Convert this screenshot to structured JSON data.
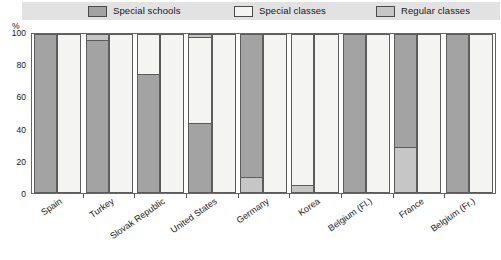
{
  "unit_label": "%",
  "legend": {
    "items": [
      {
        "label": "Special schools",
        "color": "#a3a3a3",
        "key": "special_schools"
      },
      {
        "label": "Special classes",
        "color": "#f4f4f2",
        "key": "special_classes"
      },
      {
        "label": "Regular classes",
        "color": "#c6c6c6",
        "key": "regular_classes"
      }
    ]
  },
  "yaxis": {
    "ticks": [
      "0",
      "20",
      "40",
      "60",
      "80",
      "100"
    ],
    "min": 0,
    "max": 100
  },
  "chart_data": {
    "type": "bar",
    "subtype": "grouped-stacked-100-percent",
    "title": "",
    "subtitle": "",
    "xlabel": "",
    "ylabel": "%",
    "ylim": [
      0,
      100
    ],
    "yticks": [
      0,
      20,
      40,
      60,
      80,
      100
    ],
    "grid": false,
    "legend_position": "top",
    "series_names": [
      "Special schools",
      "Special classes",
      "Regular classes"
    ],
    "series_colors": [
      "#a3a3a3",
      "#f4f4f2",
      "#c6c6c6"
    ],
    "categories": [
      "Spain",
      "Turkey",
      "Slovak Republic",
      "United States",
      "Germany",
      "Korea",
      "Belgium (Fl.)",
      "France",
      "Belgium (Fr.)"
    ],
    "groups": [
      {
        "category": "Spain",
        "bars": [
          {
            "segments": [
              {
                "series": "Special schools",
                "value": 100
              }
            ]
          },
          {
            "segments": [
              {
                "series": "Special classes",
                "value": 100
              }
            ]
          }
        ]
      },
      {
        "category": "Turkey",
        "bars": [
          {
            "segments": [
              {
                "series": "Special schools",
                "value": 96
              },
              {
                "series": "Regular classes",
                "value": 4
              }
            ]
          },
          {
            "segments": [
              {
                "series": "Special classes",
                "value": 100
              }
            ]
          }
        ]
      },
      {
        "category": "Slovak Republic",
        "bars": [
          {
            "segments": [
              {
                "series": "Special schools",
                "value": 75
              },
              {
                "series": "Special classes",
                "value": 25
              }
            ]
          },
          {
            "segments": [
              {
                "series": "Special classes",
                "value": 100
              }
            ]
          }
        ]
      },
      {
        "category": "United States",
        "bars": [
          {
            "segments": [
              {
                "series": "Special schools",
                "value": 44
              },
              {
                "series": "Special classes",
                "value": 54
              },
              {
                "series": "Regular classes",
                "value": 2
              }
            ]
          },
          {
            "segments": [
              {
                "series": "Special classes",
                "value": 100
              }
            ]
          }
        ]
      },
      {
        "category": "Germany",
        "bars": [
          {
            "segments": [
              {
                "series": "Regular classes",
                "value": 10
              },
              {
                "series": "Special schools",
                "value": 90
              }
            ]
          },
          {
            "segments": [
              {
                "series": "Special classes",
                "value": 100
              }
            ]
          }
        ]
      },
      {
        "category": "Korea",
        "bars": [
          {
            "segments": [
              {
                "series": "Regular classes",
                "value": 5
              },
              {
                "series": "Special classes",
                "value": 95
              }
            ]
          },
          {
            "segments": [
              {
                "series": "Special classes",
                "value": 100
              }
            ]
          }
        ]
      },
      {
        "category": "Belgium (Fl.)",
        "bars": [
          {
            "segments": [
              {
                "series": "Special schools",
                "value": 100
              }
            ]
          },
          {
            "segments": [
              {
                "series": "Special classes",
                "value": 100
              }
            ]
          }
        ]
      },
      {
        "category": "France",
        "bars": [
          {
            "segments": [
              {
                "series": "Regular classes",
                "value": 29
              },
              {
                "series": "Special schools",
                "value": 71
              }
            ]
          },
          {
            "segments": [
              {
                "series": "Special classes",
                "value": 100
              }
            ]
          }
        ]
      },
      {
        "category": "Belgium (Fr.)",
        "bars": [
          {
            "segments": [
              {
                "series": "Special schools",
                "value": 100
              }
            ]
          },
          {
            "segments": [
              {
                "series": "Special classes",
                "value": 100
              }
            ]
          }
        ]
      }
    ]
  }
}
